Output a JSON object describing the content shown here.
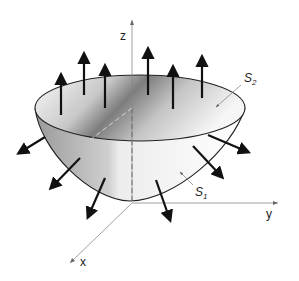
{
  "diagram": {
    "type": "3d-surface-flux",
    "axes": {
      "z": {
        "label": "z"
      },
      "y": {
        "label": "y"
      },
      "x": {
        "label": "x"
      }
    },
    "surfaces": [
      {
        "id": "S2",
        "label": "S",
        "subscript": "2",
        "role": "top flat disk"
      },
      {
        "id": "S1",
        "label": "S",
        "subscript": "1",
        "role": "curved paraboloid bowl"
      }
    ],
    "normal_vectors": {
      "on_S2": 6,
      "on_S1": 6,
      "direction_S2": "up (+z)",
      "direction_S1": "outward/downward"
    },
    "colors": {
      "stroke": "#111111",
      "axis": "#777777",
      "shade_dark": "#8a8a8a",
      "shade_light": "#f2f2f2"
    }
  }
}
